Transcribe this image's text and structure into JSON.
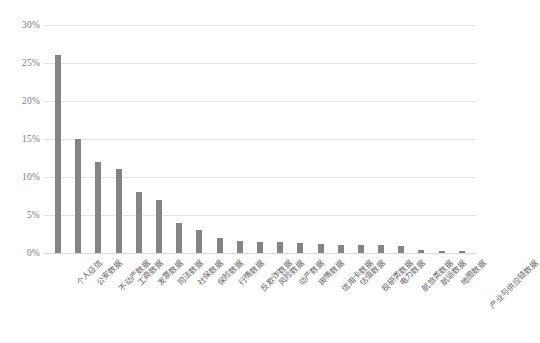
{
  "chart_data": {
    "type": "bar",
    "title": "",
    "xlabel": "",
    "ylabel": "",
    "ylim": [
      0,
      30
    ],
    "ytick_labels": [
      "30%",
      "25%",
      "20%",
      "15%",
      "10%",
      "5%",
      "0%"
    ],
    "ytick_values": [
      30,
      25,
      20,
      15,
      10,
      5,
      0
    ],
    "grid": true,
    "legend": "none",
    "bar_color": "#848484",
    "gridline_color": "#e4e4e4",
    "axis_text_color": "#7b7b7b",
    "categories": [
      "个人征信",
      "公安数据",
      "不动产数据",
      "工商数据",
      "发票数据",
      "司法数据",
      "社保数据",
      "保险数据",
      "行情数据",
      "反欺诈数据",
      "风险数据",
      "动产数据",
      "舆情数据",
      "信用卡数据",
      "估值数据",
      "投研类数据",
      "电力数据",
      "航旅类数据",
      "航运数据",
      "地图数据",
      "产业与供应链数据"
    ],
    "values": [
      26,
      15,
      12,
      11,
      8,
      7,
      4,
      3,
      2,
      1.6,
      1.5,
      1.4,
      1.3,
      1.2,
      1.1,
      1.0,
      1.0,
      0.9,
      0.45,
      0.3,
      0.3
    ]
  }
}
